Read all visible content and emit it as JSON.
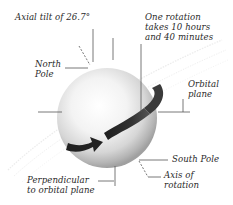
{
  "diagram": {
    "labels": {
      "axial_tilt": "Axial tilt of 26.7°",
      "rotation_line1": "One rotation",
      "rotation_line2": "takes 10 hours",
      "rotation_line3": "and 40 minutes",
      "north_pole_line1": "North",
      "north_pole_line2": "Pole",
      "orbital_plane_line1": "Orbital",
      "orbital_plane_line2": "plane",
      "south_pole": "South Pole",
      "axis_line1": "Axis of",
      "axis_line2": "rotation",
      "perpendicular_line1": "Perpendicular",
      "perpendicular_line2": "to orbital plane"
    },
    "colors": {
      "sphere_highlight": "#ffffff",
      "sphere_shadow": "#9a9a9a",
      "arrow": "#2b2b2b",
      "leader_lines": "#555555",
      "orbital_plane_faint": "#e4e4e4",
      "text": "#2a2a2a"
    }
  }
}
